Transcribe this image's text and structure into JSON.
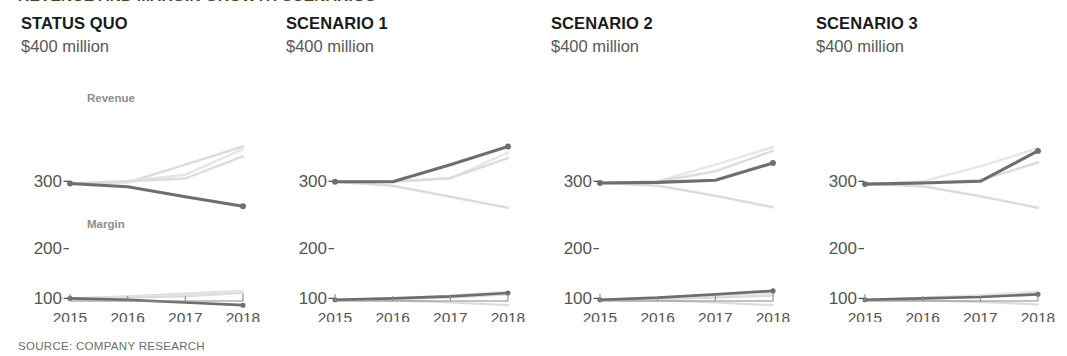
{
  "headline": {
    "text": "REVENUE AND MARGIN GROWTH SCENARIOS",
    "color": "#5b3d1d"
  },
  "source_note": "SOURCE: COMPANY RESEARCH",
  "axis": {
    "y_ticks": [
      "300",
      "200",
      "100"
    ],
    "x_ticks": [
      "2015",
      "2016",
      "2017",
      "2018"
    ],
    "unit_caption": "$400 million"
  },
  "series_labels": {
    "revenue": "Revenue",
    "margin": "Margin"
  },
  "colors": {
    "highlight_line": "#6e6e6e",
    "ghost_line": "#dcdcdc",
    "ghost_line_faint": "#e6e6e6",
    "axis_text": "#555555",
    "title_text": "#1b1b1b",
    "subtitle_text": "#585858",
    "series_label": "#8d8d8d",
    "source_text": "#6d6d6d",
    "background": "#ffffff"
  },
  "chart_data": {
    "type": "line",
    "title": "REVENUE AND MARGIN GROWTH SCENARIOS",
    "xlabel": "",
    "ylabel": "$400 million",
    "x": [
      "2015",
      "2016",
      "2017",
      "2018"
    ],
    "y_ticks": [
      300,
      200,
      100
    ],
    "ylim_revenue": [
      230,
      400
    ],
    "ylim_margin": [
      80,
      130
    ],
    "grid": false,
    "legend": "inline-annotation",
    "annotations": [
      "Revenue",
      "Margin"
    ],
    "panels": [
      {
        "title": "STATUS QUO",
        "subtitle": "$400 million",
        "revenue": {
          "highlight": {
            "name": "Status quo",
            "values": [
              296,
              290,
              272,
              255
            ]
          },
          "ghosts": [
            {
              "name": "Scenario 1",
              "values": [
                296,
                298,
                330,
                363
              ]
            },
            {
              "name": "Scenario 2",
              "values": [
                296,
                300,
                312,
                358
              ]
            },
            {
              "name": "Scenario 3",
              "values": [
                296,
                300,
                305,
                345
              ]
            }
          ]
        },
        "margin": {
          "highlight": {
            "name": "Status quo",
            "values": [
              100,
              98,
              94,
              90
            ]
          },
          "ghosts": [
            {
              "name": "Scenario 1",
              "values": [
                100,
                103,
                107,
                111
              ]
            },
            {
              "name": "Scenario 2",
              "values": [
                100,
                102,
                105,
                110
              ]
            },
            {
              "name": "Scenario 3",
              "values": [
                100,
                101,
                103,
                108
              ]
            }
          ]
        }
      },
      {
        "title": "SCENARIO 1",
        "subtitle": "$400 million",
        "revenue": {
          "highlight": {
            "name": "Scenario 1",
            "values": [
              299,
              299,
              330,
              363
            ]
          },
          "ghosts": [
            {
              "name": "Status quo",
              "values": [
                299,
                292,
                272,
                252
              ]
            },
            {
              "name": "Scenario 2",
              "values": [
                299,
                299,
                305,
                352
              ]
            },
            {
              "name": "Scenario 3",
              "values": [
                299,
                299,
                306,
                342
              ]
            }
          ]
        },
        "margin": {
          "highlight": {
            "name": "Scenario 1",
            "values": [
              98,
              100,
              103,
              108
            ]
          },
          "ghosts": [
            {
              "name": "Status quo",
              "values": [
                98,
                97,
                94,
                90
              ]
            },
            {
              "name": "Scenario 2",
              "values": [
                98,
                100,
                104,
                110
              ]
            },
            {
              "name": "Scenario 3",
              "values": [
                98,
                99,
                101,
                106
              ]
            }
          ]
        }
      },
      {
        "title": "SCENARIO 2",
        "subtitle": "$400 million",
        "revenue": {
          "highlight": {
            "name": "Scenario 2",
            "values": [
              297,
              298,
              302,
              333
            ]
          },
          "ghosts": [
            {
              "name": "Status quo",
              "values": [
                297,
                292,
                274,
                253
              ]
            },
            {
              "name": "Scenario 1",
              "values": [
                297,
                300,
                330,
                362
              ]
            },
            {
              "name": "Scenario 3",
              "values": [
                297,
                299,
                318,
                355
              ]
            }
          ]
        },
        "margin": {
          "highlight": {
            "name": "Scenario 2",
            "values": [
              98,
              101,
              106,
              111
            ]
          },
          "ghosts": [
            {
              "name": "Status quo",
              "values": [
                98,
                97,
                94,
                90
              ]
            },
            {
              "name": "Scenario 1",
              "values": [
                98,
                100,
                103,
                107
              ]
            },
            {
              "name": "Scenario 3",
              "values": [
                98,
                99,
                101,
                104
              ]
            }
          ]
        }
      },
      {
        "title": "SCENARIO 3",
        "subtitle": "$400 million",
        "revenue": {
          "highlight": {
            "name": "Scenario 3",
            "values": [
              295,
              297,
              300,
              355
            ]
          },
          "ghosts": [
            {
              "name": "Status quo",
              "values": [
                295,
                291,
                273,
                252
              ]
            },
            {
              "name": "Scenario 1",
              "values": [
                295,
                300,
                327,
                360
              ]
            },
            {
              "name": "Scenario 2",
              "values": [
                295,
                298,
                302,
                334
              ]
            }
          ]
        },
        "margin": {
          "highlight": {
            "name": "Scenario 3",
            "values": [
              98,
              100,
              102,
              106
            ]
          },
          "ghosts": [
            {
              "name": "Status quo",
              "values": [
                98,
                97,
                95,
                91
              ]
            },
            {
              "name": "Scenario 1",
              "values": [
                98,
                101,
                105,
                110
              ]
            },
            {
              "name": "Scenario 2",
              "values": [
                98,
                100,
                103,
                107
              ]
            }
          ]
        }
      }
    ]
  }
}
